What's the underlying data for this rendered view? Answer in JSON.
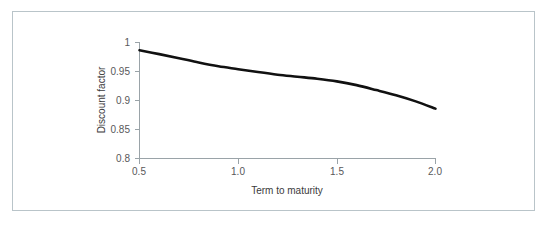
{
  "figure": {
    "border_color": "#b9c4c9",
    "background": "#ffffff"
  },
  "chart_data": {
    "type": "line",
    "title": "",
    "subtitle": "",
    "xlabel": "Term to maturity",
    "ylabel": "Discount factor",
    "xlim": [
      0.5,
      2.0
    ],
    "ylim": [
      0.8,
      1.0
    ],
    "xticks": [
      0.5,
      1.0,
      1.5,
      2.0
    ],
    "xtick_labels": [
      "0.5",
      "1.0",
      "1.5",
      "2.0"
    ],
    "yticks": [
      0.8,
      0.85,
      0.9,
      0.95,
      1.0
    ],
    "ytick_labels": [
      "0.8",
      "0.85",
      "0.9",
      "0.95",
      "1"
    ],
    "grid": false,
    "legend": false,
    "legend_position": "none",
    "series": [
      {
        "name": "Discount factor",
        "color": "#111111",
        "line_width": 2.6,
        "x": [
          0.5,
          0.6,
          0.7,
          0.8,
          0.9,
          1.0,
          1.1,
          1.2,
          1.3,
          1.4,
          1.5,
          1.6,
          1.7,
          1.8,
          1.9,
          2.0
        ],
        "y": [
          0.9865,
          0.98,
          0.973,
          0.9655,
          0.959,
          0.954,
          0.949,
          0.9445,
          0.941,
          0.9375,
          0.933,
          0.9265,
          0.918,
          0.909,
          0.8985,
          0.886
        ]
      }
    ]
  },
  "axes": {
    "x_axis_name": "x-axis",
    "y_axis_name": "y-axis"
  }
}
